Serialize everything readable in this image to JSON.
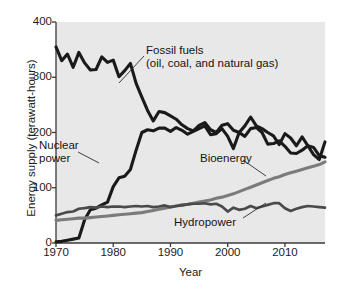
{
  "chart_data": {
    "type": "line",
    "title": "",
    "xlabel": "Year",
    "ylabel": "Energy supply (terawatt-hours)",
    "xlim": [
      1970,
      2017
    ],
    "ylim": [
      0,
      400
    ],
    "xticks": [
      1970,
      1980,
      1990,
      2000,
      2010
    ],
    "yticks": [
      0,
      100,
      200,
      300,
      400
    ],
    "grid": false,
    "legend_position": "inline-annotations",
    "plot_background": "#e8e8e8",
    "x": [
      1970,
      1971,
      1972,
      1973,
      1974,
      1975,
      1976,
      1977,
      1978,
      1979,
      1980,
      1981,
      1982,
      1983,
      1984,
      1985,
      1986,
      1987,
      1988,
      1989,
      1990,
      1991,
      1992,
      1993,
      1994,
      1995,
      1996,
      1997,
      1998,
      1999,
      2000,
      2001,
      2002,
      2003,
      2004,
      2005,
      2006,
      2007,
      2008,
      2009,
      2010,
      2011,
      2012,
      2013,
      2014,
      2015,
      2016,
      2017
    ],
    "series": [
      {
        "name": "Fossil fuels (oil, coal, and natural gas)",
        "color": "#1a1a1a",
        "width": 3.1,
        "values": [
          355,
          330,
          342,
          318,
          345,
          326,
          313,
          314,
          337,
          327,
          331,
          301,
          312,
          325,
          289,
          264,
          240,
          221,
          238,
          236,
          230,
          224,
          214,
          207,
          203,
          213,
          218,
          205,
          200,
          213,
          216,
          204,
          200,
          212,
          228,
          212,
          207,
          200,
          194,
          178,
          198,
          190,
          176,
          192,
          176,
          160,
          151,
          183
        ]
      },
      {
        "name": "Nuclear power",
        "color": "#1a1a1a",
        "width": 3.1,
        "values": [
          2,
          3,
          5,
          7,
          9,
          42,
          60,
          63,
          69,
          74,
          102,
          118,
          121,
          133,
          168,
          200,
          205,
          203,
          208,
          208,
          202,
          209,
          204,
          197,
          202,
          207,
          212,
          196,
          198,
          207,
          193,
          171,
          200,
          193,
          207,
          209,
          200,
          179,
          180,
          185,
          175,
          163,
          162,
          168,
          176,
          173,
          158,
          155
        ]
      },
      {
        "name": "Bioenergy",
        "color": "#7b7b7b",
        "width": 3.1,
        "values": [
          41,
          42,
          43,
          44,
          45,
          45,
          46,
          47,
          48,
          49,
          50,
          51,
          52,
          53,
          54,
          55,
          57,
          59,
          61,
          63,
          65,
          67,
          69,
          70,
          72,
          74,
          76,
          78,
          81,
          83,
          86,
          89,
          93,
          97,
          101,
          105,
          109,
          113,
          117,
          120,
          124,
          127,
          130,
          133,
          136,
          139,
          142,
          147
        ]
      },
      {
        "name": "Hydropower",
        "color": "#4a4a4a",
        "width": 2.7,
        "values": [
          50,
          53,
          56,
          57,
          62,
          63,
          65,
          64,
          66,
          65,
          66,
          66,
          65,
          66,
          67,
          66,
          67,
          65,
          66,
          68,
          65,
          67,
          68,
          70,
          71,
          71,
          72,
          70,
          71,
          66,
          57,
          64,
          60,
          62,
          67,
          63,
          66,
          69,
          72,
          72,
          63,
          58,
          62,
          65,
          67,
          66,
          65,
          64
        ]
      }
    ]
  },
  "axis": {
    "ylabel": "Energy supply (terawatt-hours)",
    "xlabel": "Year",
    "yticks": [
      "0",
      "100",
      "200",
      "300",
      "400"
    ],
    "xticks": [
      "1970",
      "1980",
      "1990",
      "2000",
      "2010"
    ]
  },
  "annotations": {
    "fossil_line1": "Fossil fuels",
    "fossil_line2": "(oil, coal, and natural gas)",
    "nuclear_line1": "Nuclear",
    "nuclear_line2": "power",
    "bioenergy": "Bioenergy",
    "hydropower": "Hydropower"
  },
  "colors": {
    "fossil": "#1a1a1a",
    "nuclear": "#1a1a1a",
    "bioenergy": "#7b7b7b",
    "hydropower": "#4a4a4a",
    "plot_background": "#e8e8e8",
    "axis": "#3a3a3a"
  }
}
